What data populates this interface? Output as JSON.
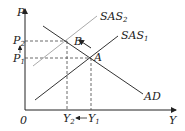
{
  "diagram": {
    "type": "AS-AD shift",
    "axes": {
      "y_label": "P",
      "x_label": "Y",
      "origin_label": "0"
    },
    "curves": [
      {
        "id": "SAS2",
        "label_main": "SAS",
        "label_sub": "2",
        "color": "#aaaaaa"
      },
      {
        "id": "SAS1",
        "label_main": "SAS",
        "label_sub": "1",
        "color": "#333333"
      },
      {
        "id": "AD",
        "label_main": "AD",
        "label_sub": "",
        "color": "#333333"
      }
    ],
    "points": [
      {
        "id": "A",
        "label": "A"
      },
      {
        "id": "B",
        "label": "B"
      }
    ],
    "price_levels": [
      {
        "label_main": "P",
        "label_sub": "2"
      },
      {
        "label_main": "P",
        "label_sub": "1"
      }
    ],
    "output_levels": [
      {
        "label_main": "Y",
        "label_sub": "2"
      },
      {
        "label_main": "Y",
        "label_sub": "1"
      }
    ],
    "arrows": {
      "price": "P1 → P2 (up)",
      "output": "Y1 → Y2 (left)",
      "movement": "A → B along AD"
    }
  }
}
